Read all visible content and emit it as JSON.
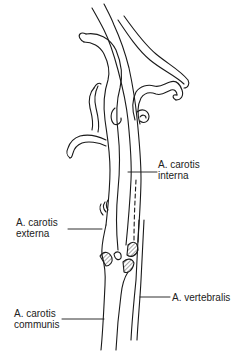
{
  "diagram": {
    "type": "anatomical line drawing",
    "colors": {
      "line": "#1a1a1a",
      "background": "#ffffff"
    }
  },
  "labels": {
    "interna": {
      "line1": "A. carotis",
      "line2": "interna"
    },
    "externa": {
      "line1": "A. carotis",
      "line2": "externa"
    },
    "communis": {
      "line1": "A. carotis",
      "line2": "communis"
    },
    "vertebralis": {
      "line1": "A. vertebralis"
    }
  }
}
